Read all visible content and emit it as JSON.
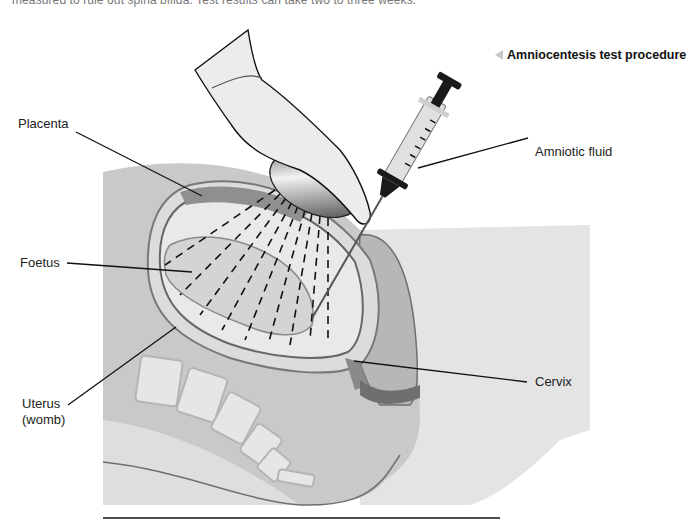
{
  "intro_text": "measured to rule out spina bifida. Test results can take two to three weeks.",
  "caption": {
    "icon": "triangle-left-icon",
    "text": "Amniocentesis test procedure"
  },
  "labels": {
    "placenta": "Placenta",
    "foetus": "Foetus",
    "uterus_line1": "Uterus",
    "uterus_line2": "(womb)",
    "amniotic_fluid": "Amniotic fluid",
    "cervix": "Cervix"
  },
  "colors": {
    "body_light": "#d9d9d9",
    "body_mid": "#bdbdbd",
    "placenta": "#8f8f8f",
    "line": "#111111",
    "caption_marker": "#c8c8c8"
  }
}
